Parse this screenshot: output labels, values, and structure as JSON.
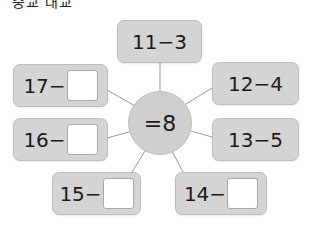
{
  "header": {
    "fragment": "중교 대교"
  },
  "center": {
    "label": "=8"
  },
  "boxes": [
    {
      "id": "top",
      "expr": "11−3",
      "has_blank": false
    },
    {
      "id": "upper-left",
      "expr": "17−",
      "has_blank": true
    },
    {
      "id": "upper-right",
      "expr": "12−4",
      "has_blank": false
    },
    {
      "id": "mid-left",
      "expr": "16−",
      "has_blank": true
    },
    {
      "id": "mid-right",
      "expr": "13−5",
      "has_blank": false
    },
    {
      "id": "lower-left",
      "expr": "15−",
      "has_blank": true
    },
    {
      "id": "lower-right",
      "expr": "14−",
      "has_blank": true
    }
  ],
  "colors": {
    "box_fill": "#d4d4d4",
    "box_border": "#bdbdbd",
    "line": "#9a9a9a",
    "blank_fill": "#ffffff"
  }
}
